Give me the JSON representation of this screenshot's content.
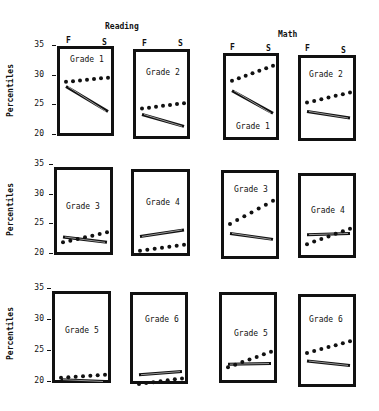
{
  "chart_data": {
    "type": "line",
    "title": "",
    "section_titles": [
      "Reading",
      "Math"
    ],
    "x_categories": [
      "F",
      "S"
    ],
    "xlabel": "",
    "ylabel": "Percentiles",
    "ylim": [
      20,
      35
    ],
    "yticks": [
      20,
      25,
      30,
      35
    ],
    "legend": [],
    "series_styles": {
      "dotted": "dotted line (series A)",
      "solid": "solid double line (series B)"
    },
    "panels": [
      {
        "subject": "Reading",
        "grade": "Grade 1",
        "dotted": [
          29.3,
          30.0
        ],
        "solid": [
          28.5,
          24.3
        ]
      },
      {
        "subject": "Reading",
        "grade": "Grade 2",
        "dotted": [
          24.8,
          25.7
        ],
        "solid": [
          23.8,
          21.8
        ]
      },
      {
        "subject": "Math",
        "grade": "Grade 1",
        "dotted": [
          29.5,
          32.0
        ],
        "solid": [
          27.8,
          24.0
        ]
      },
      {
        "subject": "Math",
        "grade": "Grade 2",
        "dotted": [
          25.8,
          27.5
        ],
        "solid": [
          24.3,
          23.2
        ]
      },
      {
        "subject": "Reading",
        "grade": "Grade 3",
        "dotted": [
          22.3,
          24.0
        ],
        "solid": [
          23.2,
          22.3
        ]
      },
      {
        "subject": "Reading",
        "grade": "Grade 4",
        "dotted": [
          20.9,
          21.9
        ],
        "solid": [
          23.3,
          24.4
        ]
      },
      {
        "subject": "Math",
        "grade": "Grade 3",
        "dotted": [
          25.4,
          29.3
        ],
        "solid": [
          23.8,
          22.8
        ]
      },
      {
        "subject": "Math",
        "grade": "Grade 4",
        "dotted": [
          22.0,
          24.6
        ],
        "solid": [
          23.6,
          23.8
        ]
      },
      {
        "subject": "Reading",
        "grade": "Grade 5",
        "dotted": [
          21.0,
          21.5
        ],
        "solid": [
          20.7,
          20.4
        ]
      },
      {
        "subject": "Reading",
        "grade": "Grade 6",
        "dotted": [
          20.0,
          20.9
        ],
        "solid": [
          21.5,
          22.0
        ]
      },
      {
        "subject": "Math",
        "grade": "Grade 5",
        "dotted": [
          22.7,
          25.2
        ],
        "solid": [
          23.2,
          23.3
        ]
      },
      {
        "subject": "Math",
        "grade": "Grade 6",
        "dotted": [
          25.0,
          26.9
        ],
        "solid": [
          23.7,
          23.0
        ]
      }
    ]
  },
  "labels": {
    "reading": "Reading",
    "math": "Math",
    "f": "F",
    "s": "S",
    "percentiles": "Percentiles",
    "ticks": [
      "35",
      "30",
      "25",
      "20"
    ]
  }
}
